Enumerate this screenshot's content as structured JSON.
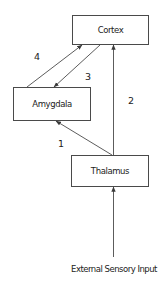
{
  "diagram": {
    "nodes": [
      {
        "id": "cortex",
        "label": "Cortex",
        "x": 72,
        "y": 15,
        "w": 76,
        "h": 29
      },
      {
        "id": "amygdala",
        "label": "Amygdala",
        "x": 13,
        "y": 87,
        "w": 77,
        "h": 33
      },
      {
        "id": "thalamus",
        "label": "Thalamus",
        "x": 71,
        "y": 155,
        "w": 77,
        "h": 31
      }
    ],
    "edges": [
      {
        "id": "1",
        "label": "1",
        "from": "thalamus",
        "to": "amygdala"
      },
      {
        "id": "2",
        "label": "2",
        "from": "thalamus",
        "to": "cortex"
      },
      {
        "id": "3",
        "label": "3",
        "from": "cortex",
        "to": "amygdala"
      },
      {
        "id": "4",
        "label": "4",
        "from": "amygdala",
        "to": "cortex"
      },
      {
        "id": "input",
        "label": "",
        "from": "external-sensory-input",
        "to": "thalamus"
      }
    ],
    "input_label": "External Sensory Input",
    "colors": {
      "line": "#4a4a4a",
      "text": "#222222",
      "background": "#ffffff"
    }
  }
}
